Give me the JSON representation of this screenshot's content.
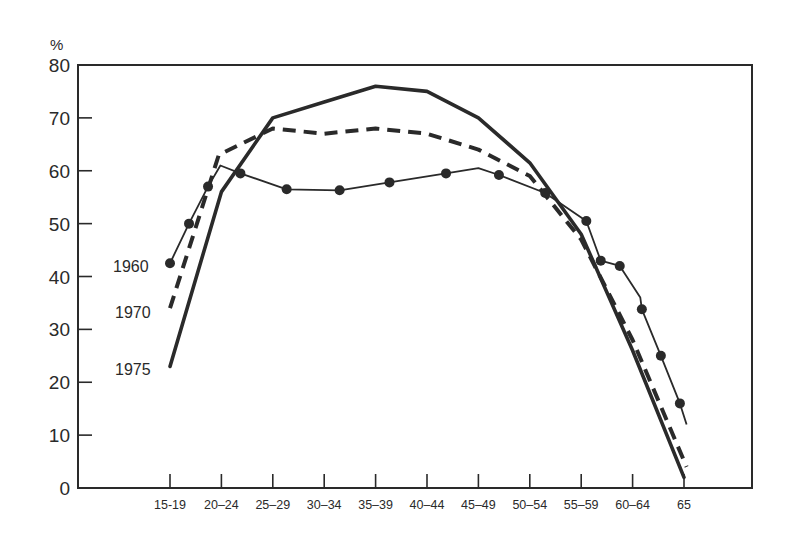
{
  "chart_data": {
    "type": "line",
    "title": "",
    "ylabel": "%",
    "xlabel": "",
    "ylim": [
      0,
      80
    ],
    "yticks": [
      0,
      10,
      20,
      30,
      40,
      50,
      60,
      70,
      80
    ],
    "grid": false,
    "legend_position": "inline-left",
    "categories": [
      "15-19",
      "20-24",
      "25-29",
      "30-34",
      "35-39",
      "40-44",
      "45-49",
      "50-54",
      "55-59",
      "60-64",
      "65"
    ],
    "series": [
      {
        "name": "1960",
        "style": "thin-solid-with-dots",
        "values": [
          42.5,
          59.5,
          56.5,
          56.3,
          57.8,
          59.5,
          59.2,
          55.8,
          50.5,
          42.0,
          12.0
        ],
        "points": [
          {
            "x": 0.0,
            "y": 42.5,
            "dot": true
          },
          {
            "x": 0.37,
            "y": 50.0,
            "dot": true
          },
          {
            "x": 0.74,
            "y": 57.0,
            "dot": true
          },
          {
            "x": 0.98,
            "y": 61.0,
            "dot": false
          },
          {
            "x": 1.37,
            "y": 59.5,
            "dot": true
          },
          {
            "x": 2.27,
            "y": 56.5,
            "dot": true
          },
          {
            "x": 3.3,
            "y": 56.3,
            "dot": true
          },
          {
            "x": 4.27,
            "y": 57.8,
            "dot": true
          },
          {
            "x": 5.37,
            "y": 59.5,
            "dot": true
          },
          {
            "x": 6.0,
            "y": 60.5,
            "dot": false
          },
          {
            "x": 6.4,
            "y": 59.2,
            "dot": true
          },
          {
            "x": 7.3,
            "y": 55.8,
            "dot": true
          },
          {
            "x": 8.1,
            "y": 50.5,
            "dot": true
          },
          {
            "x": 8.38,
            "y": 43.0,
            "dot": true
          },
          {
            "x": 8.75,
            "y": 42.0,
            "dot": true
          },
          {
            "x": 9.15,
            "y": 36.0,
            "dot": false
          },
          {
            "x": 9.18,
            "y": 33.8,
            "dot": true
          },
          {
            "x": 9.55,
            "y": 25.0,
            "dot": true
          },
          {
            "x": 9.92,
            "y": 16.0,
            "dot": true
          },
          {
            "x": 10.05,
            "y": 12.0,
            "dot": false
          }
        ]
      },
      {
        "name": "1970",
        "style": "thick-dashed",
        "values": [
          34,
          63,
          68,
          67,
          68,
          67,
          64,
          59,
          47,
          28,
          4
        ],
        "points": [
          {
            "x": 0.0,
            "y": 34.0
          },
          {
            "x": 0.95,
            "y": 63.0
          },
          {
            "x": 2.0,
            "y": 68.0
          },
          {
            "x": 3.0,
            "y": 67.0
          },
          {
            "x": 4.0,
            "y": 68.0
          },
          {
            "x": 5.0,
            "y": 67.0
          },
          {
            "x": 6.0,
            "y": 64.0
          },
          {
            "x": 7.0,
            "y": 59.0
          },
          {
            "x": 8.0,
            "y": 47.0
          },
          {
            "x": 9.0,
            "y": 28.0
          },
          {
            "x": 10.05,
            "y": 4.0
          }
        ]
      },
      {
        "name": "1975",
        "style": "thick-solid",
        "values": [
          23,
          56,
          70,
          73,
          76,
          75,
          70,
          62,
          49,
          26,
          2
        ],
        "points": [
          {
            "x": 0.0,
            "y": 23.0
          },
          {
            "x": 1.0,
            "y": 56.0
          },
          {
            "x": 2.0,
            "y": 70.0
          },
          {
            "x": 3.0,
            "y": 73.0
          },
          {
            "x": 4.0,
            "y": 76.0
          },
          {
            "x": 5.0,
            "y": 75.0
          },
          {
            "x": 6.0,
            "y": 70.0
          },
          {
            "x": 7.0,
            "y": 61.5
          },
          {
            "x": 8.0,
            "y": 48.0
          },
          {
            "x": 9.0,
            "y": 26.0
          },
          {
            "x": 10.0,
            "y": 2.0
          }
        ]
      }
    ],
    "annotations": [
      {
        "text": "1960",
        "near_series": "1960",
        "position": "left of start"
      },
      {
        "text": "1970",
        "near_series": "1970",
        "position": "left of start"
      },
      {
        "text": "1975",
        "near_series": "1975",
        "position": "left of start"
      }
    ]
  },
  "axis": {
    "unit_label": "%",
    "y_tick_labels": [
      "0",
      "10",
      "20",
      "30",
      "40",
      "50",
      "60",
      "70",
      "80"
    ],
    "x_tick_labels": [
      "15-19",
      "20–24",
      "25–29",
      "30–34",
      "35–39",
      "40–44",
      "45–49",
      "50–54",
      "55–59",
      "60–64",
      "65"
    ]
  },
  "series_labels": {
    "s1960": "1960",
    "s1970": "1970",
    "s1975": "1975"
  },
  "colors": {
    "ink": "#2a2a2a",
    "background": "#ffffff"
  }
}
